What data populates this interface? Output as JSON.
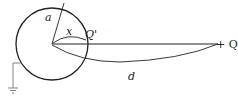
{
  "labels": {
    "radius": "a",
    "image_distance": "x",
    "image_charge": "Q'",
    "charge": "+ Q",
    "distance": "d"
  },
  "colors": {
    "stroke": "#222222",
    "ground": "#777777"
  }
}
